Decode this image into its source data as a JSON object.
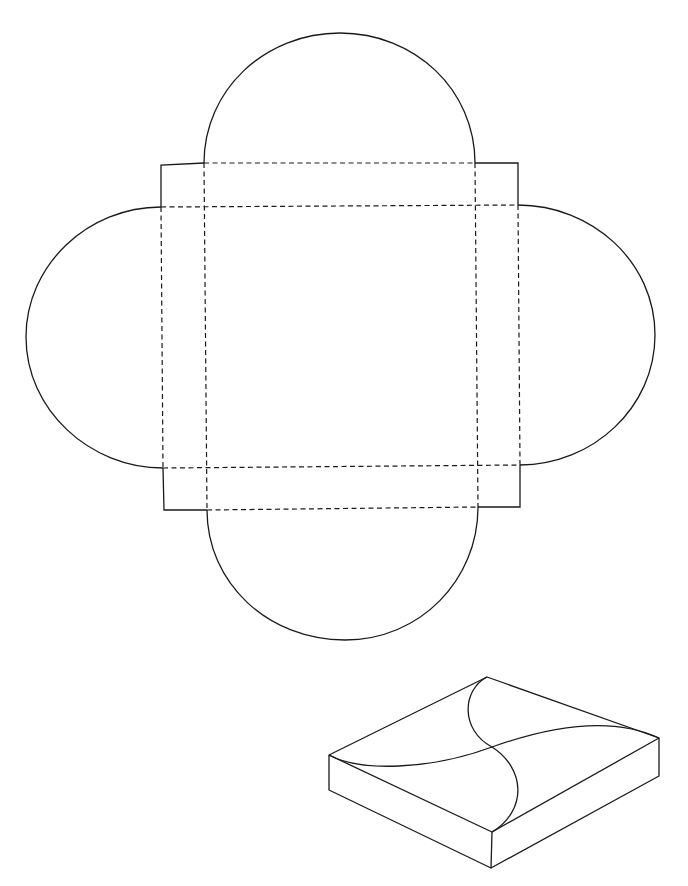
{
  "diagram": {
    "type": "box-net-template",
    "colors": {
      "background": "#ffffff",
      "line": "#1a1a1a"
    },
    "net": {
      "square_panel": {
        "x": 204,
        "y": 205,
        "right": 477,
        "bottom": 467
      },
      "line_styles": {
        "cut": "solid",
        "fold": "dashed"
      },
      "flaps": [
        {
          "name": "top-flap",
          "shape": "semicircle"
        },
        {
          "name": "right-flap",
          "shape": "semicircle"
        },
        {
          "name": "bottom-flap",
          "shape": "semicircle"
        },
        {
          "name": "left-flap",
          "shape": "semicircle"
        }
      ],
      "corner_tabs": [
        "top-left",
        "top-right",
        "bottom-right",
        "bottom-left"
      ]
    },
    "assembled_view": {
      "projection": "isometric",
      "lid_pattern": "four interlocking semicircular flaps forming an S-curve cross"
    }
  }
}
